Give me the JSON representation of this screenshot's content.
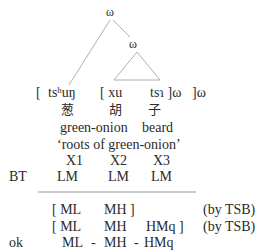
{
  "tree": {
    "root_label": "ω",
    "child_label": "ω"
  },
  "segments": {
    "bracket_open_1": "[",
    "syllable_1": "tsʰuŋ",
    "bracket_open_2": "[ xu",
    "syllable_3": "tsɿ ]ω",
    "bracket_close_outer": "]ω"
  },
  "characters": [
    "葱",
    "胡",
    "子"
  ],
  "glosses": {
    "word_1": "green-onion",
    "word_2": "beard",
    "translation": "‘roots of green-onion’"
  },
  "slots": [
    "X1",
    "X2",
    "X3"
  ],
  "base_tone": {
    "label": "BT",
    "tones": [
      "LM",
      "LM",
      "LM"
    ]
  },
  "derivation": [
    {
      "label": "",
      "cells": [
        "[ ML",
        "MH ]",
        ""
      ],
      "note": "(by TSB)"
    },
    {
      "label": "",
      "cells": [
        "[ ML",
        "MH",
        "HMq ]"
      ],
      "note": "(by TSB)"
    },
    {
      "label": "ok",
      "cells": [
        "ML",
        "-",
        "MH",
        "-",
        "HMq"
      ],
      "note": ""
    }
  ],
  "colors": {
    "text": "#2a2a2a",
    "lines": "#9a9a9a",
    "background": "#ffffff"
  }
}
